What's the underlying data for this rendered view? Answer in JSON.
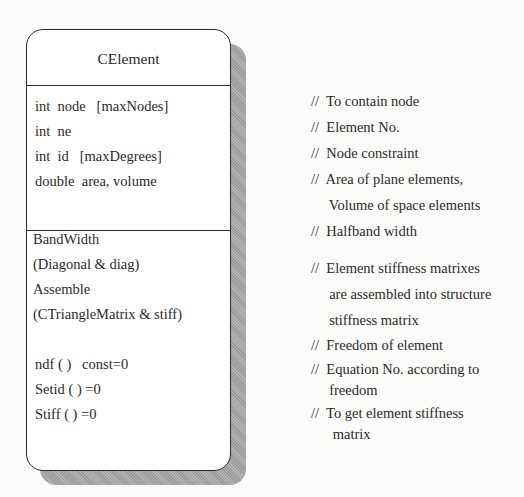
{
  "class_name": "CElement",
  "attributes": [
    "int  node   [maxNodes]",
    "int  ne",
    "int  id   [maxDegrees]",
    "double  area, volume"
  ],
  "operations": [
    "BandWidth",
    "(Diagonal & diag)",
    "Assemble",
    "(CTriangleMatrix & stiff)",
    "ndf ( )   const=0",
    "Setid ( ) =0",
    "Stiff ( ) =0"
  ],
  "comments": [
    "//  To contain node",
    "//  Element No.",
    "//  Node constraint",
    "//  Area of plane elements,",
    "     Volume of space elements",
    "//  Halfband width",
    "//  Element stiffness matrixes",
    "     are assembled into structure",
    "     stiffness matrix",
    "//  Freedom of element",
    "//  Equation No. according to",
    "     freedom",
    "//  To get element stiffness",
    "      matrix"
  ]
}
